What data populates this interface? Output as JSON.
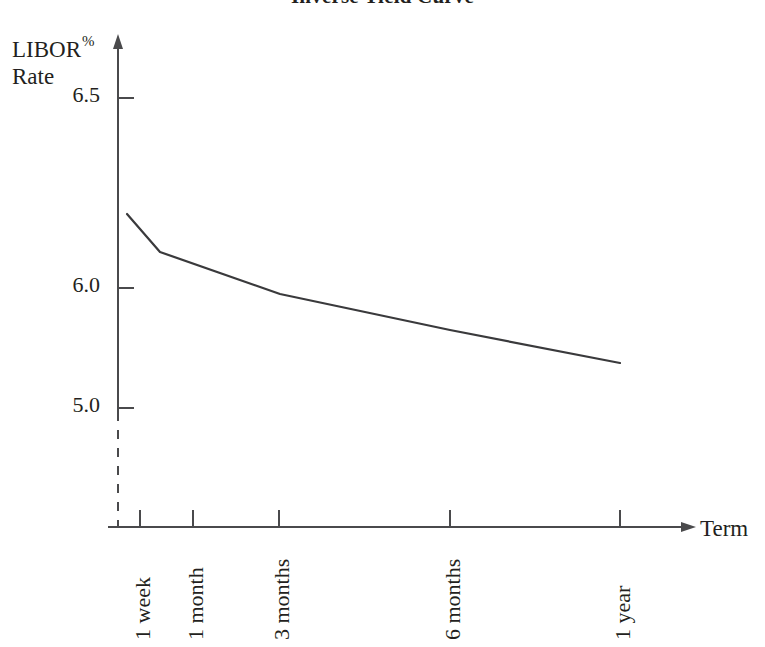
{
  "chart_data": {
    "type": "line",
    "title": "Inverse Yield Curve",
    "xlabel": "Term",
    "ylabel": "LIBOR % Rate",
    "ylabel_line1": "LIBOR",
    "ylabel_line1_sup": "%",
    "ylabel_line2": "Rate",
    "categories": [
      "1 week",
      "1 month",
      "3 months",
      "6 months",
      "1 year"
    ],
    "values": [
      6.2,
      6.1,
      5.98,
      5.84,
      5.7
    ],
    "series": [
      {
        "name": "LIBOR Rate",
        "values": [
          6.2,
          6.1,
          5.98,
          5.84,
          5.7
        ]
      }
    ],
    "ytick_labels": [
      "6.5",
      "6.0",
      "5.0"
    ],
    "ytick_values": [
      6.5,
      6.0,
      5.0
    ],
    "ylim": [
      5.0,
      6.6
    ],
    "axis_break": true,
    "axis_break_note": "y-axis dashed below 5.0 indicating scale break",
    "grid": false,
    "legend": "none",
    "line_color": "#3a3a3c",
    "axis_color": "#4a4a4c"
  },
  "axes": {
    "y_ticks": [
      {
        "label": "6.5",
        "value": 6.5,
        "y_px": 98
      },
      {
        "label": "6.0",
        "value": 6.0,
        "y_px": 288
      },
      {
        "label": "5.0",
        "value": 5.0,
        "y_px": 408
      }
    ],
    "x_ticks": [
      {
        "label": "1 week",
        "x_px": 140
      },
      {
        "label": "1 month",
        "x_px": 193
      },
      {
        "label": "3 months",
        "x_px": 279
      },
      {
        "label": "6 months",
        "x_px": 450
      },
      {
        "label": "1 year",
        "x_px": 620
      }
    ],
    "curve_points_px": [
      {
        "x": 127,
        "y": 214
      },
      {
        "x": 160,
        "y": 252
      },
      {
        "x": 280,
        "y": 294
      },
      {
        "x": 450,
        "y": 330
      },
      {
        "x": 620,
        "y": 363
      }
    ]
  }
}
